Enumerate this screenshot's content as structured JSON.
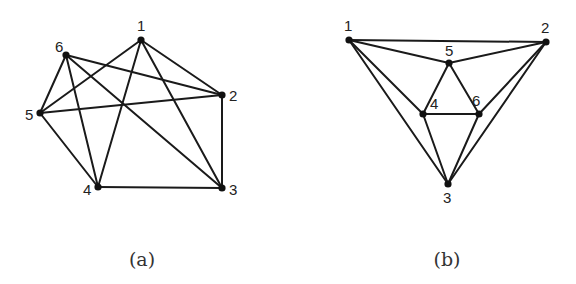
{
  "figures": [
    {
      "id": "a",
      "caption": "(a)",
      "caption_pos": [
        142,
        266
      ],
      "nodes": [
        {
          "label": "1",
          "x": 141,
          "y": 40,
          "lx": 137,
          "ly": 31
        },
        {
          "label": "2",
          "x": 222,
          "y": 95,
          "lx": 229,
          "ly": 101
        },
        {
          "label": "3",
          "x": 222,
          "y": 188,
          "lx": 229,
          "ly": 195
        },
        {
          "label": "4",
          "x": 98,
          "y": 187,
          "lx": 83,
          "ly": 195
        },
        {
          "label": "5",
          "x": 40,
          "y": 113,
          "lx": 25,
          "ly": 120
        },
        {
          "label": "6",
          "x": 66,
          "y": 55,
          "lx": 55,
          "ly": 52
        }
      ],
      "edges": [
        [
          1,
          2
        ],
        [
          1,
          3
        ],
        [
          1,
          4
        ],
        [
          1,
          5
        ],
        [
          6,
          2
        ],
        [
          6,
          5
        ],
        [
          6,
          4
        ],
        [
          6,
          3
        ],
        [
          5,
          2
        ],
        [
          5,
          4
        ],
        [
          4,
          3
        ],
        [
          2,
          3
        ]
      ]
    },
    {
      "id": "b",
      "caption": "(b)",
      "caption_pos": [
        447,
        266
      ],
      "nodes": [
        {
          "label": "1",
          "x": 349,
          "y": 40,
          "lx": 344,
          "ly": 31
        },
        {
          "label": "2",
          "x": 546,
          "y": 42,
          "lx": 541,
          "ly": 33
        },
        {
          "label": "3",
          "x": 448,
          "y": 184,
          "lx": 443,
          "ly": 203
        },
        {
          "label": "4",
          "x": 423,
          "y": 114,
          "lx": 430,
          "ly": 109
        },
        {
          "label": "5",
          "x": 449,
          "y": 63,
          "lx": 445,
          "ly": 56
        },
        {
          "label": "6",
          "x": 479,
          "y": 114,
          "lx": 472,
          "ly": 106
        }
      ],
      "edges": [
        [
          1,
          2
        ],
        [
          1,
          5
        ],
        [
          2,
          5
        ],
        [
          1,
          4
        ],
        [
          1,
          3
        ],
        [
          2,
          6
        ],
        [
          2,
          3
        ],
        [
          5,
          4
        ],
        [
          5,
          6
        ],
        [
          4,
          6
        ],
        [
          4,
          3
        ],
        [
          6,
          3
        ]
      ]
    }
  ]
}
